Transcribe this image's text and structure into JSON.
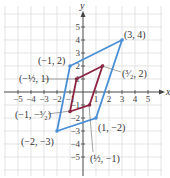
{
  "chart_data": {
    "type": "diagram",
    "title": "",
    "xlabel": "x",
    "ylabel": "y",
    "xlim": [
      -6,
      6
    ],
    "ylim": [
      -6,
      6
    ],
    "grid": true,
    "x_ticks": [
      "-5",
      "-4",
      "-3",
      "-2",
      "-1",
      "1",
      "2",
      "3",
      "4",
      "5"
    ],
    "y_ticks": [
      "5",
      "4",
      "3",
      "2",
      "1",
      "-1",
      "-2",
      "-3",
      "-4",
      "-5"
    ],
    "shapes": [
      {
        "name": "outer-parallelogram",
        "color": "#4a8fd6",
        "vertices": [
          [
            -2,
            -3
          ],
          [
            -1,
            2
          ],
          [
            3,
            4
          ],
          [
            1,
            -2
          ]
        ],
        "labels": [
          "(-2, -3)",
          "(-1, 2)",
          "(3, 4)",
          "(1, -2)"
        ]
      },
      {
        "name": "inner-parallelogram",
        "color": "#8b2340",
        "vertices": [
          [
            -0.5,
            1
          ],
          [
            1.5,
            2
          ],
          [
            0.5,
            -1
          ],
          [
            -1,
            -1.5
          ]
        ],
        "labels": [
          "(-1/2, 1)",
          "(3/2, 2)",
          "(1/2, -1)",
          "(-1, -3/2)"
        ]
      }
    ]
  },
  "axes": {
    "x_label": "x",
    "y_label": "y"
  },
  "labels": {
    "p_3_4": "(3, 4)",
    "p_m1_2": "(−1, 2)",
    "p_1_m2": "(1, −2)",
    "p_m2_m3": "(−2, −3)",
    "p_mhalf_1": "(−½, 1)",
    "p_3half_2": "(³⁄₂, 2)",
    "p_half_m1": "(½, −1)",
    "p_m1_m3half": "(−1, −³⁄₂)"
  }
}
